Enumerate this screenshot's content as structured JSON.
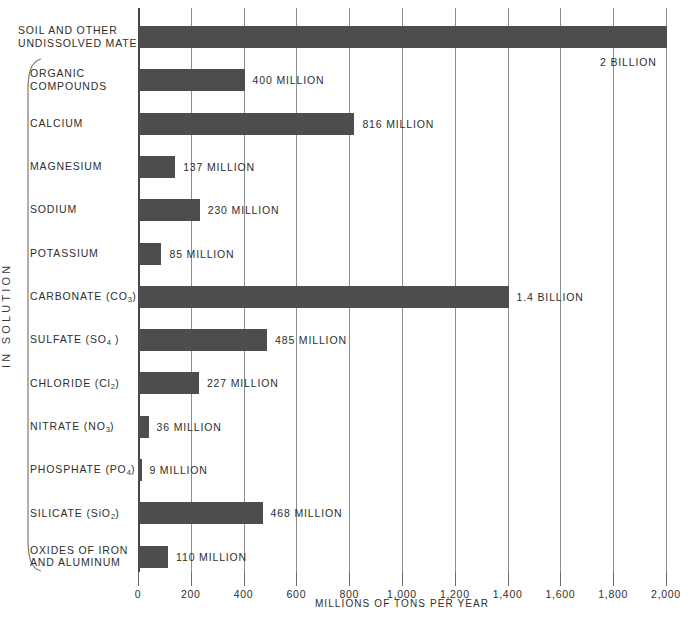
{
  "chart_data": {
    "type": "bar",
    "orientation": "horizontal",
    "title": "",
    "xlabel": "MILLIONS OF TONS PER YEAR",
    "ylabel": "IN SOLUTION",
    "xlim": [
      0,
      2000
    ],
    "xticks": [
      0,
      200,
      400,
      600,
      800,
      1000,
      1200,
      1400,
      1600,
      1800,
      2000
    ],
    "xticklabels": [
      "0",
      "200",
      "400",
      "600",
      "800",
      "1,000",
      "1,200",
      "1,400",
      "1,600",
      "1,800",
      "2,000"
    ],
    "grid": true,
    "legend": null,
    "bar_color": "#4d4d4d",
    "categories": [
      "SOIL AND OTHER UNDISSOLVED MATERIAL",
      "ORGANIC COMPOUNDS",
      "CALCIUM",
      "MAGNESIUM",
      "SODIUM",
      "POTASSIUM",
      "CARBONATE (CO3)",
      "SULFATE (SO4)",
      "CHLORIDE (Cl2)",
      "NITRATE (NO3)",
      "PHOSPHATE (PO4)",
      "SILICATE (SiO2)",
      "OXIDES OF IRON AND ALUMINUM"
    ],
    "values": [
      2000,
      400,
      816,
      137,
      230,
      85,
      1400,
      485,
      227,
      36,
      9,
      468,
      110
    ],
    "value_labels": [
      "2 BILLION",
      "400 MILLION",
      "816 MILLION",
      "137 MILLION",
      "230 MILLION",
      "85 MILLION",
      "1.4 BILLION",
      "485 MILLION",
      "227 MILLION",
      "36 MILLION",
      "9 MILLION",
      "468 MILLION",
      "110 MILLION"
    ]
  },
  "rows": [
    {
      "label_lines": [
        "SOIL AND OTHER",
        "UNDISSOLVED MATERIAL"
      ],
      "formula_sub": "",
      "value": 2000,
      "value_label": "2 BILLION",
      "label_below_bar": true,
      "in_solution_group": false
    },
    {
      "label_lines": [
        "ORGANIC",
        "COMPOUNDS"
      ],
      "formula_sub": "",
      "value": 400,
      "value_label": "400 MILLION",
      "label_below_bar": false,
      "in_solution_group": true
    },
    {
      "label_lines": [
        "CALCIUM"
      ],
      "formula_sub": "",
      "value": 816,
      "value_label": "816 MILLION",
      "label_below_bar": false,
      "in_solution_group": true
    },
    {
      "label_lines": [
        "MAGNESIUM"
      ],
      "formula_sub": "",
      "value": 137,
      "value_label": "137 MILLION",
      "label_below_bar": false,
      "in_solution_group": true
    },
    {
      "label_lines": [
        "SODIUM"
      ],
      "formula_sub": "",
      "value": 230,
      "value_label": "230 MILLION",
      "label_below_bar": false,
      "in_solution_group": true
    },
    {
      "label_lines": [
        "POTASSIUM"
      ],
      "formula_sub": "",
      "value": 85,
      "value_label": "85 MILLION",
      "label_below_bar": false,
      "in_solution_group": true
    },
    {
      "label_lines": [
        "CARBONATE  (CO"
      ],
      "formula_sub": "3",
      "formula_tail": ")",
      "value": 1400,
      "value_label": "1.4 BILLION",
      "label_below_bar": false,
      "in_solution_group": true
    },
    {
      "label_lines": [
        "SULFATE  (SO"
      ],
      "formula_sub": "4",
      "formula_tail": " )",
      "value": 485,
      "value_label": "485 MILLION",
      "label_below_bar": false,
      "in_solution_group": true
    },
    {
      "label_lines": [
        "CHLORIDE  (Cl"
      ],
      "formula_sub": "2",
      "formula_tail": ")",
      "value": 227,
      "value_label": "227 MILLION",
      "label_below_bar": false,
      "in_solution_group": true
    },
    {
      "label_lines": [
        "NITRATE  (NO"
      ],
      "formula_sub": "3",
      "formula_tail": ")",
      "value": 36,
      "value_label": "36 MILLION",
      "label_below_bar": false,
      "in_solution_group": true
    },
    {
      "label_lines": [
        "PHOSPHATE  (PO"
      ],
      "formula_sub": "4",
      "formula_tail": ")",
      "value": 9,
      "value_label": "9 MILLION",
      "label_below_bar": false,
      "in_solution_group": true
    },
    {
      "label_lines": [
        "SILICATE   (SiO"
      ],
      "formula_sub": "2",
      "formula_tail": ")",
      "value": 468,
      "value_label": "468 MILLION",
      "label_below_bar": false,
      "in_solution_group": true
    },
    {
      "label_lines": [
        "OXIDES OF IRON",
        "AND ALUMINUM"
      ],
      "formula_sub": "",
      "value": 110,
      "value_label": "110 MILLION",
      "label_below_bar": false,
      "in_solution_group": true
    }
  ],
  "axis": {
    "title": "MILLIONS OF TONS PER YEAR",
    "group_label": "IN SOLUTION",
    "ticklabels": [
      "0",
      "200",
      "400",
      "600",
      "800",
      "1,000",
      "1,200",
      "1,400",
      "1,600",
      "1,800",
      "2,000"
    ]
  }
}
